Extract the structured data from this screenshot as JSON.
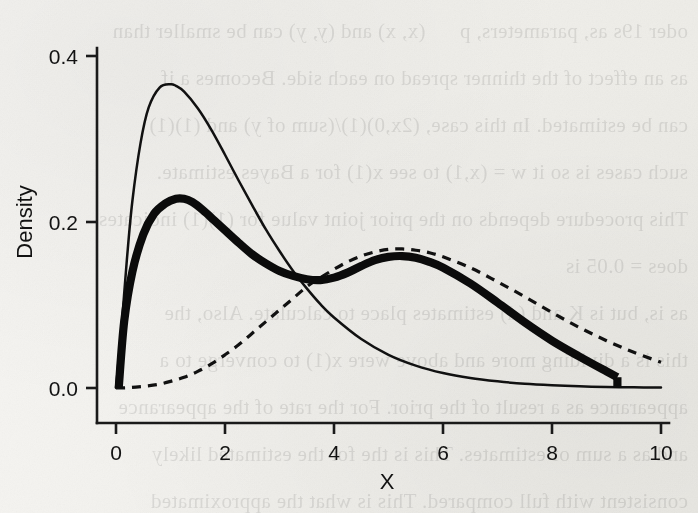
{
  "figure": {
    "kind": "scanned-book-figure",
    "background_color": "#f2f1ed",
    "ink_color": "#111111"
  },
  "bleed_through_text": "oder 19s as, parameters, p      (x, x) and (y, y) can be smaller than\nas an effect of the thinner spread on each side. Becomes a if\ncan be estimated. In this case, (2x,0)(1)/(sum of y) and (1)(1)\nsuch cases is so it w = (x,1) to see x(1) for a Bayes estimate.\nThis procedure depends on the prior joint value for (1)(1) indicates\ndoes = 0.05 is\nas is, but is K and (d) estimates place to calculate. Also, the\nthis is a dividing more and above were x(1) to converge to a\nappearance as a result of the prior. For the rate of the appearance\nand as a sum of estimates. This is the for the estimated likely\nconsistent with full compared. This is what the approximated\nprocedure will no more be found by other values of\ncan distribution sufficient with certain estimated number for",
  "chart_data": {
    "type": "line",
    "title": "",
    "xlabel": "X",
    "ylabel": "Density",
    "xlim": [
      0,
      10
    ],
    "ylim": [
      0,
      0.45
    ],
    "xticks": [
      0,
      2,
      4,
      6,
      8,
      10
    ],
    "xtick_labels": [
      "0",
      "2",
      "4",
      "6",
      "8",
      "10"
    ],
    "yticks": [
      0.0,
      0.2,
      0.4
    ],
    "ytick_labels": [
      "0.0",
      "0.2",
      "0.4"
    ],
    "grid": false,
    "legend": "none",
    "series": [
      {
        "name": "component-1-density",
        "style": "thin-solid",
        "linewidth": 1,
        "dash": "none",
        "x": [
          0.0,
          0.1,
          0.2,
          0.3,
          0.45,
          0.6,
          0.8,
          1.0,
          1.1,
          1.25,
          1.5,
          1.75,
          2.0,
          2.25,
          2.5,
          2.75,
          3.0,
          3.25,
          3.5,
          3.75,
          4.0,
          4.5,
          5.0,
          5.5,
          6.0,
          6.5,
          7.0,
          7.5,
          8.0,
          8.5,
          9.0,
          9.5,
          10.0
        ],
        "y": [
          0.0,
          0.072,
          0.155,
          0.225,
          0.295,
          0.338,
          0.362,
          0.366,
          0.364,
          0.357,
          0.337,
          0.311,
          0.281,
          0.25,
          0.22,
          0.191,
          0.165,
          0.141,
          0.12,
          0.101,
          0.085,
          0.059,
          0.04,
          0.027,
          0.018,
          0.012,
          0.008,
          0.005,
          0.0032,
          0.002,
          0.0013,
          0.0008,
          0.0005
        ]
      },
      {
        "name": "component-2-density",
        "style": "dashed",
        "linewidth": 1,
        "dash": "dashed",
        "x": [
          0.0,
          0.25,
          0.5,
          0.75,
          1.0,
          1.25,
          1.5,
          1.75,
          2.0,
          2.25,
          2.5,
          2.75,
          3.0,
          3.25,
          3.5,
          3.75,
          4.0,
          4.25,
          4.5,
          4.75,
          5.0,
          5.25,
          5.5,
          5.75,
          6.0,
          6.5,
          7.0,
          7.5,
          8.0,
          8.5,
          9.0,
          9.5,
          10.0
        ],
        "y": [
          0.0,
          0.0005,
          0.002,
          0.004,
          0.008,
          0.013,
          0.02,
          0.029,
          0.04,
          0.052,
          0.066,
          0.08,
          0.094,
          0.108,
          0.122,
          0.133,
          0.143,
          0.152,
          0.159,
          0.164,
          0.167,
          0.1675,
          0.166,
          0.163,
          0.158,
          0.145,
          0.128,
          0.11,
          0.091,
          0.073,
          0.057,
          0.043,
          0.031
        ]
      },
      {
        "name": "mixture-density",
        "style": "thick-solid",
        "linewidth": 3,
        "dash": "none",
        "x": [
          0.05,
          0.15,
          0.3,
          0.5,
          0.7,
          0.9,
          1.1,
          1.25,
          1.4,
          1.6,
          1.8,
          2.0,
          2.25,
          2.5,
          2.75,
          3.0,
          3.25,
          3.5,
          3.75,
          4.0,
          4.25,
          4.5,
          4.75,
          5.0,
          5.25,
          5.5,
          5.75,
          6.0,
          6.5,
          7.0,
          7.5,
          8.0,
          8.5,
          9.0,
          9.2
        ],
        "y": [
          0.0,
          0.08,
          0.14,
          0.185,
          0.21,
          0.222,
          0.228,
          0.228,
          0.224,
          0.214,
          0.202,
          0.19,
          0.175,
          0.161,
          0.15,
          0.141,
          0.135,
          0.131,
          0.13,
          0.133,
          0.139,
          0.147,
          0.154,
          0.158,
          0.159,
          0.157,
          0.152,
          0.145,
          0.126,
          0.103,
          0.079,
          0.057,
          0.038,
          0.02,
          0.013
        ]
      }
    ],
    "annotations": {
      "mixture_truncated_at_x": 9.2,
      "mixture_drops_vertically_to_zero": true
    }
  }
}
